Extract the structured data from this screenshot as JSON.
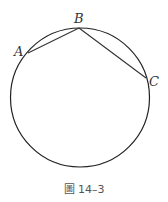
{
  "figure": {
    "caption": "圖 14–3",
    "circle": {
      "cx": 80,
      "cy": 97.5,
      "r": 69.5,
      "stroke": "#222222"
    },
    "points": {
      "A": {
        "label": "A",
        "x": 28,
        "y": 53,
        "label_x": 14,
        "label_y": 56
      },
      "B": {
        "label": "B",
        "x": 79,
        "y": 28,
        "label_x": 74,
        "label_y": 23
      },
      "C": {
        "label": "C",
        "x": 146,
        "y": 78,
        "label_x": 149,
        "label_y": 86
      }
    },
    "chords": [
      {
        "from": "A",
        "to": "B"
      },
      {
        "from": "B",
        "to": "C"
      }
    ]
  }
}
